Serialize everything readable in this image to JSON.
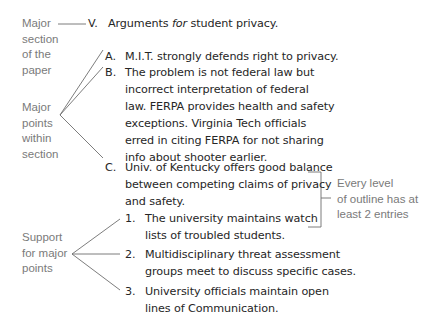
{
  "annotations": {
    "major_section": [
      "Major",
      "section",
      "of the",
      "paper"
    ],
    "major_points": [
      "Major",
      "points",
      "within",
      "section"
    ],
    "support": [
      "Support",
      "for major",
      "points"
    ],
    "every_level": [
      "Every level",
      "of outline has at",
      "least 2 entries"
    ]
  },
  "outline": {
    "section": {
      "marker": "V.",
      "text_before": "Arguments ",
      "text_italic": "for",
      "text_after": " student privacy."
    },
    "points": [
      {
        "marker": "A.",
        "lines": [
          "M.I.T. strongly defends right to privacy."
        ]
      },
      {
        "marker": "B.",
        "lines": [
          "The problem is not federal law but",
          "incorrect interpretation of federal",
          "law. FERPA provides health and safety",
          "exceptions. Virginia Tech officials",
          "erred in citing FERPA for not sharing",
          "info about shooter earlier."
        ]
      },
      {
        "marker": "C.",
        "lines": [
          "Univ. of Kentucky offers good balance",
          "between competing claims of privacy",
          "and safety."
        ]
      }
    ],
    "support": [
      {
        "marker": "1.",
        "lines": [
          "The university maintains watch",
          "lists of troubled students."
        ]
      },
      {
        "marker": "2.",
        "lines": [
          "Multidisciplinary threat assessment",
          "groups meet to discuss specific cases."
        ]
      },
      {
        "marker": "3.",
        "lines": [
          "University officials maintain open",
          "lines of Communication."
        ]
      }
    ]
  },
  "colors": {
    "text": "#262626",
    "annotation": "#7a7a7a",
    "connector": "#6e6e6e"
  }
}
